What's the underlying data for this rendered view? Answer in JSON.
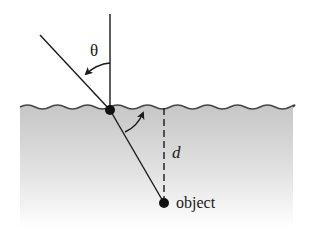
{
  "figure": {
    "labels": {
      "angle": "θ",
      "depth": "d",
      "object": "object"
    },
    "colors": {
      "line": "#1a1a1a",
      "water_top": "#c8c8c8",
      "water_bottom": "#ffffff",
      "background": "#ffffff"
    },
    "geometry": {
      "surface_point": [
        110,
        110
      ],
      "object_point": [
        164,
        203
      ],
      "ray_start": [
        40,
        35
      ],
      "normal_top": [
        110,
        14
      ],
      "water_left": 20,
      "water_right": 293,
      "surface_y": 107
    }
  }
}
